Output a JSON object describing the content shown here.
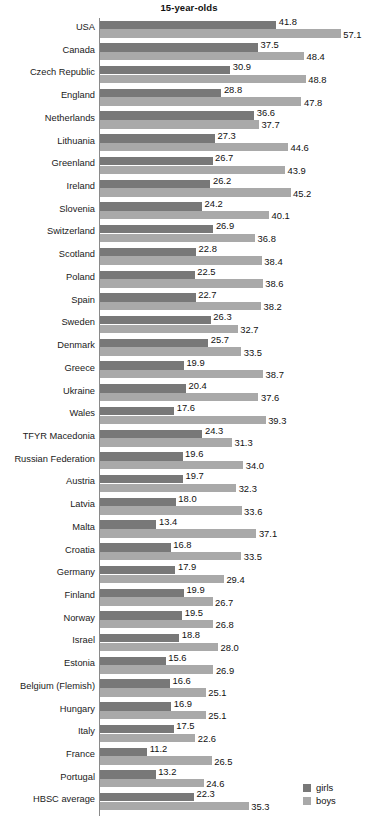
{
  "chart_data": {
    "type": "bar",
    "orientation": "horizontal",
    "grouped": true,
    "title": "15-year-olds",
    "xlabel": "",
    "ylabel": "",
    "grid": false,
    "legend_position": "bottom-right",
    "xlim": [
      0,
      60
    ],
    "categories": [
      "USA",
      "Canada",
      "Czech Republic",
      "England",
      "Netherlands",
      "Lithuania",
      "Greenland",
      "Ireland",
      "Slovenia",
      "Switzerland",
      "Scotland",
      "Poland",
      "Spain",
      "Sweden",
      "Denmark",
      "Greece",
      "Ukraine",
      "Wales",
      "TFYR Macedonia",
      "Russian Federation",
      "Austria",
      "Latvia",
      "Malta",
      "Croatia",
      "Germany",
      "Finland",
      "Norway",
      "Israel",
      "Estonia",
      "Belgium (Flemish)",
      "Hungary",
      "Italy",
      "France",
      "Portugal",
      "HBSC average"
    ],
    "series": [
      {
        "name": "girls",
        "color": "#787878",
        "values": [
          41.8,
          37.5,
          30.9,
          28.8,
          36.6,
          27.3,
          26.7,
          26.2,
          24.2,
          26.9,
          22.8,
          22.5,
          22.7,
          26.3,
          25.7,
          19.9,
          20.4,
          17.6,
          24.3,
          19.6,
          19.7,
          18.0,
          13.4,
          16.8,
          17.9,
          19.9,
          19.5,
          18.8,
          15.6,
          16.6,
          16.9,
          17.5,
          11.2,
          13.2,
          22.3
        ],
        "labels": [
          "41.8",
          "37.5",
          "30.9",
          "28.8",
          "36.6",
          "27.3",
          "26.7",
          "26.2",
          "24.2",
          "26.9",
          "22.8",
          "22.5",
          "22.7",
          "26.3",
          "25.7",
          "19.9",
          "20.4",
          "17.6",
          "24.3",
          "19.6",
          "19.7",
          "18.0",
          "13.4",
          "16.8",
          "17.9",
          "19.9",
          "19.5",
          "18.8",
          "15.6",
          "16.6",
          "16.9",
          "17.5",
          "11.2",
          "13.2",
          "22.3"
        ]
      },
      {
        "name": "boys",
        "color": "#a9a9a9",
        "values": [
          57.1,
          48.4,
          48.8,
          47.8,
          37.7,
          44.6,
          43.9,
          45.2,
          40.1,
          36.8,
          38.4,
          38.6,
          38.2,
          32.7,
          33.5,
          38.7,
          37.6,
          39.3,
          31.3,
          34.0,
          32.3,
          33.6,
          37.1,
          33.5,
          29.4,
          26.7,
          26.8,
          28.0,
          26.9,
          25.1,
          25.1,
          22.6,
          26.5,
          24.6,
          35.3
        ],
        "labels": [
          "57.1",
          "48.4",
          "48.8",
          "47.8",
          "37.7",
          "44.6",
          "43.9",
          "45.2",
          "40.1",
          "36.8",
          "38.4",
          "38.6",
          "38.2",
          "32.7",
          "33.5",
          "38.7",
          "37.6",
          "39.3",
          "31.3",
          "34.0",
          "32.3",
          "33.6",
          "37.1",
          "33.5",
          "29.4",
          "26.7",
          "26.8",
          "28.0",
          "26.9",
          "25.1",
          "25.1",
          "22.6",
          "26.5",
          "24.6",
          "35.3"
        ]
      }
    ]
  },
  "legend": {
    "items": [
      {
        "label": "girls",
        "color": "#787878"
      },
      {
        "label": "boys",
        "color": "#a9a9a9"
      }
    ]
  }
}
